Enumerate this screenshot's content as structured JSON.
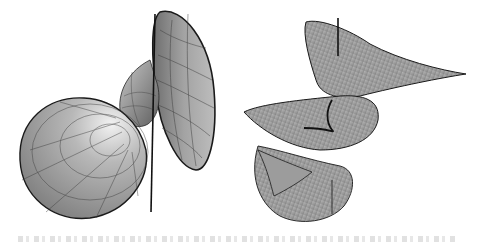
{
  "figure": {
    "panels": [
      {
        "id": "left",
        "description": "Shaded 3D surface with a funnel/trumpet lobe (upper right) and a rounded disc lobe (lower left) joined by a twisted neck, drawn with a coordinate mesh and a straight vertical axis line"
      },
      {
        "id": "right",
        "description": "Helicoidal ruled surface spiralling around a vertical axis, with dense radial rulings and a curved central core line"
      }
    ],
    "colors": {
      "surface_fill": "#9a9a9a",
      "surface_highlight": "#e6e6e6",
      "mesh_line": "#3a3a3a",
      "outline": "#1a1a1a",
      "background": "#ffffff"
    },
    "caption": {
      "visible": false,
      "note": "caption line clipped at bottom edge; text not legible"
    }
  }
}
